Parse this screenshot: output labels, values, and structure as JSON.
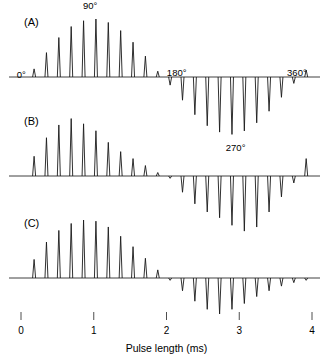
{
  "figure": {
    "title": "",
    "axis": {
      "xlabel": "Pulse length (ms)",
      "xticks": [
        "0",
        "1",
        "2",
        "3",
        "4"
      ],
      "xlim": [
        0,
        4
      ]
    },
    "panels": [
      {
        "id": "A",
        "label": "(A)"
      },
      {
        "id": "B",
        "label": "(B)"
      },
      {
        "id": "C",
        "label": "(C)"
      }
    ],
    "annotations": [
      {
        "name": "flip-angle-0",
        "text": "0°",
        "panel": "A"
      },
      {
        "name": "flip-angle-90",
        "text": "90°",
        "panel": "A"
      },
      {
        "name": "flip-angle-180",
        "text": "180°",
        "panel": "A"
      },
      {
        "name": "flip-angle-270",
        "text": "270°",
        "panel": "A"
      },
      {
        "name": "flip-angle-360",
        "text": "360°",
        "panel": "A"
      }
    ],
    "colors": {
      "trace": "#1a1a1a",
      "background": "#ffffff",
      "text": "#000000"
    }
  },
  "chart_data": {
    "type": "line",
    "title": "",
    "subtitle": "",
    "xlabel": "Pulse length (ms)",
    "ylabel": "",
    "xlim": [
      0,
      4
    ],
    "xticks": [
      0,
      1,
      2,
      3,
      4
    ],
    "grid": false,
    "legend": null,
    "annotations": [
      {
        "text": "0°",
        "x": 0.12,
        "y": 0.05,
        "panel": "A"
      },
      {
        "text": "90°",
        "x": 0.95,
        "y": 1.1,
        "panel": "A"
      },
      {
        "text": "180°",
        "x": 1.95,
        "y": 0.08,
        "panel": "A"
      },
      {
        "text": "270°",
        "x": 2.95,
        "y": -1.1,
        "panel": "A"
      },
      {
        "text": "360°",
        "x": 3.9,
        "y": 0.08,
        "panel": "A"
      }
    ],
    "series": [
      {
        "name": "(A)",
        "panel": "A",
        "x": [
          0.18,
          0.35,
          0.52,
          0.69,
          0.86,
          1.03,
          1.2,
          1.37,
          1.54,
          1.71,
          1.88,
          2.05,
          2.22,
          2.39,
          2.56,
          2.73,
          2.9,
          3.07,
          3.24,
          3.41,
          3.58,
          3.75,
          3.92
        ],
        "values": [
          0.14,
          0.42,
          0.68,
          0.87,
          0.97,
          1.0,
          0.94,
          0.8,
          0.6,
          0.36,
          0.1,
          -0.14,
          -0.4,
          -0.65,
          -0.84,
          -0.95,
          -0.99,
          -0.93,
          -0.79,
          -0.59,
          -0.35,
          -0.11,
          0.12
        ]
      },
      {
        "name": "(B)",
        "panel": "B",
        "x": [
          0.18,
          0.35,
          0.52,
          0.69,
          0.86,
          1.03,
          1.2,
          1.37,
          1.54,
          1.71,
          1.88,
          2.05,
          2.22,
          2.39,
          2.56,
          2.73,
          2.9,
          3.07,
          3.24,
          3.41,
          3.58,
          3.75,
          3.92
        ],
        "values": [
          0.34,
          0.66,
          0.88,
          0.99,
          0.9,
          0.78,
          0.58,
          0.42,
          0.3,
          0.18,
          0.06,
          -0.04,
          -0.28,
          -0.48,
          -0.62,
          -0.72,
          -0.85,
          -0.95,
          -0.88,
          -0.62,
          -0.36,
          -0.12,
          0.3
        ]
      },
      {
        "name": "(C)",
        "panel": "C",
        "x": [
          0.18,
          0.35,
          0.52,
          0.69,
          0.86,
          1.03,
          1.2,
          1.37,
          1.54,
          1.71,
          1.88,
          2.05,
          2.22,
          2.39,
          2.56,
          2.73,
          2.9,
          3.07,
          3.24,
          3.41,
          3.58,
          3.75,
          3.92
        ],
        "values": [
          0.32,
          0.62,
          0.82,
          0.94,
          1.0,
          0.98,
          0.88,
          0.72,
          0.54,
          0.34,
          0.14,
          -0.04,
          -0.22,
          -0.4,
          -0.54,
          -0.62,
          -0.54,
          -0.44,
          -0.32,
          -0.22,
          -0.14,
          -0.08,
          -0.04
        ]
      }
    ]
  }
}
